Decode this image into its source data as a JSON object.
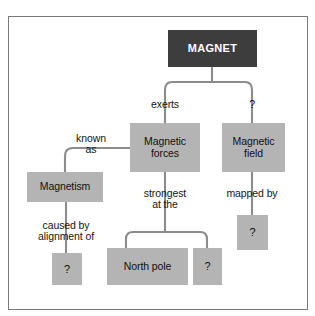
{
  "diagram": {
    "type": "concept-map",
    "colors": {
      "root_fill": "#3d3d3d",
      "root_text": "#ffffff",
      "node_fill": "#b4b4b4",
      "node_text": "#101010",
      "connector": "#8a8c8e",
      "frame_border": "#77797b",
      "background": "#ffffff"
    },
    "nodes": [
      {
        "id": "magnet",
        "label": "MAGNET",
        "kind": "root"
      },
      {
        "id": "magnetic-forces",
        "label": "Magnetic\nforces",
        "kind": "concept"
      },
      {
        "id": "magnetic-field",
        "label": "Magnetic\nfield",
        "kind": "concept"
      },
      {
        "id": "magnetism",
        "label": "Magnetism",
        "kind": "concept"
      },
      {
        "id": "north-pole",
        "label": "North pole",
        "kind": "concept"
      },
      {
        "id": "blank-pole",
        "label": "?",
        "kind": "blank"
      },
      {
        "id": "blank-alignment",
        "label": "?",
        "kind": "blank"
      },
      {
        "id": "blank-mapped-by",
        "label": "?",
        "kind": "blank"
      }
    ],
    "edges": [
      {
        "id": "magnet-forces",
        "from": "magnet",
        "to": "magnetic-forces",
        "label": "exerts"
      },
      {
        "id": "magnet-field",
        "from": "magnet",
        "to": "magnetic-field",
        "label": "?"
      },
      {
        "id": "forces-magnetism",
        "from": "magnetic-forces",
        "to": "magnetism",
        "label": "known\nas"
      },
      {
        "id": "forces-poles",
        "from": "magnetic-forces",
        "to": "north-pole",
        "label": "strongest\nat the"
      },
      {
        "id": "field-mapped",
        "from": "magnetic-field",
        "to": "blank-mapped-by",
        "label": "mapped by"
      },
      {
        "id": "magnetism-alignment",
        "from": "magnetism",
        "to": "blank-alignment",
        "label": "caused by\nalignment of"
      }
    ]
  }
}
